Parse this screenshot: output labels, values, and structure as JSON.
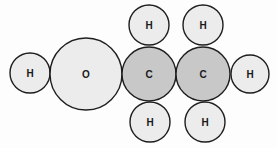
{
  "diagram": {
    "colors": {
      "hydrogen": "#ececec",
      "oxygen": "#ececec",
      "carbon": "#c8c8c8",
      "outline": "#1e1e1e"
    },
    "atoms": [
      {
        "id": "h-left",
        "element": "H",
        "label": "H",
        "type": "hydrogen"
      },
      {
        "id": "o",
        "element": "O",
        "label": "O",
        "type": "oxygen"
      },
      {
        "id": "c1-h-top",
        "element": "H",
        "label": "H",
        "type": "hydrogen"
      },
      {
        "id": "c1-h-bottom",
        "element": "H",
        "label": "H",
        "type": "hydrogen"
      },
      {
        "id": "c2-h-top",
        "element": "H",
        "label": "H",
        "type": "hydrogen"
      },
      {
        "id": "c2-h-bottom",
        "element": "H",
        "label": "H",
        "type": "hydrogen"
      },
      {
        "id": "c1",
        "element": "C",
        "label": "C",
        "type": "carbon"
      },
      {
        "id": "c2",
        "element": "C",
        "label": "C",
        "type": "carbon"
      },
      {
        "id": "h-right",
        "element": "H",
        "label": "H",
        "type": "hydrogen"
      }
    ]
  }
}
